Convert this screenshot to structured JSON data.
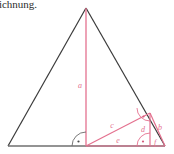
{
  "caption": {
    "text": "eichnung."
  },
  "colors": {
    "outline": "#3a3a3a",
    "baseline": "#6f6f6f",
    "accent": "#e4718f",
    "accent_light": "#efa6bb",
    "background": "#ffffff",
    "text": "#2b2b2b"
  },
  "figure": {
    "labels": {
      "a": "a",
      "b": "b",
      "c": "c",
      "d": "d",
      "e": "e",
      "f": "f"
    },
    "right_angle_markers": 3
  },
  "chart_data": {
    "type": "diagram",
    "title": "",
    "shapes": [
      {
        "name": "outer-triangle",
        "kind": "polygon",
        "stroke": "#3a3a3a",
        "points": [
          [
            86,
            8
          ],
          [
            8,
            146
          ],
          [
            165,
            146
          ]
        ]
      },
      {
        "name": "altitude-a",
        "kind": "line",
        "stroke": "#e4718f",
        "from": [
          86,
          8
        ],
        "to": [
          86,
          146
        ],
        "label": "a"
      },
      {
        "name": "hypotenuse-c",
        "kind": "line",
        "stroke": "#e4718f",
        "from": [
          86,
          146
        ],
        "to": [
          150,
          113
        ],
        "label": "c"
      },
      {
        "name": "leg-b",
        "kind": "line",
        "stroke": "#e4718f",
        "from": [
          150,
          113
        ],
        "to": [
          165,
          146
        ],
        "label": "b"
      },
      {
        "name": "leg-d",
        "kind": "line",
        "stroke": "#e4718f",
        "from": [
          150,
          113
        ],
        "to": [
          150,
          146
        ],
        "label": "d"
      },
      {
        "name": "base-e",
        "kind": "line",
        "stroke": "#e4718f",
        "from": [
          86,
          146
        ],
        "to": [
          165,
          146
        ],
        "label": "e"
      },
      {
        "name": "baseline",
        "kind": "line",
        "stroke": "#6f6f6f",
        "from": [
          8,
          146
        ],
        "to": [
          165,
          146
        ]
      }
    ],
    "label_positions": [
      {
        "key": "a",
        "text": "a",
        "x": 80,
        "y": 88
      },
      {
        "key": "c",
        "text": "c",
        "x": 112,
        "y": 128
      },
      {
        "key": "d",
        "text": "d",
        "x": 143,
        "y": 132
      },
      {
        "key": "b",
        "text": "b",
        "x": 160,
        "y": 130
      },
      {
        "key": "e",
        "text": "e",
        "x": 118,
        "y": 143
      },
      {
        "key": "f",
        "text": "f",
        "x": 155,
        "y": 145
      }
    ]
  }
}
